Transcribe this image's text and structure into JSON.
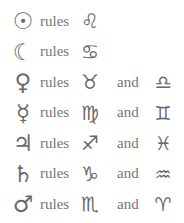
{
  "rulerships": [
    {
      "planet": "Sun",
      "planet_symbol": "☉",
      "verb": "rules",
      "signs": [
        {
          "name": "Leo",
          "symbol": "♌"
        }
      ],
      "conjunction": ""
    },
    {
      "planet": "Moon",
      "planet_symbol": "☾",
      "verb": "rules",
      "signs": [
        {
          "name": "Cancer",
          "symbol": "♋"
        }
      ],
      "conjunction": ""
    },
    {
      "planet": "Venus",
      "planet_symbol": "♀",
      "verb": "rules",
      "signs": [
        {
          "name": "Taurus",
          "symbol": "♉"
        },
        {
          "name": "Libra",
          "symbol": "♎"
        }
      ],
      "conjunction": "and"
    },
    {
      "planet": "Mercury",
      "planet_symbol": "☿",
      "verb": "rules",
      "signs": [
        {
          "name": "Virgo",
          "symbol": "♍"
        },
        {
          "name": "Gemini",
          "symbol": "♊"
        }
      ],
      "conjunction": "and"
    },
    {
      "planet": "Jupiter",
      "planet_symbol": "♃",
      "verb": "rules",
      "signs": [
        {
          "name": "Sagittarius",
          "symbol": "♐"
        },
        {
          "name": "Pisces",
          "symbol": "♓"
        }
      ],
      "conjunction": "and"
    },
    {
      "planet": "Saturn",
      "planet_symbol": "♄",
      "verb": "rules",
      "signs": [
        {
          "name": "Capricorn",
          "symbol": "♑"
        },
        {
          "name": "Aquarius",
          "symbol": "♒"
        }
      ],
      "conjunction": "and"
    },
    {
      "planet": "Mars",
      "planet_symbol": "♂",
      "verb": "rules",
      "signs": [
        {
          "name": "Scorpio",
          "symbol": "♏"
        },
        {
          "name": "Aries",
          "symbol": "♈"
        }
      ],
      "conjunction": "and"
    }
  ],
  "colors": {
    "background": "#ffffff",
    "text": "#777777",
    "symbols": "#6a6a6a"
  }
}
